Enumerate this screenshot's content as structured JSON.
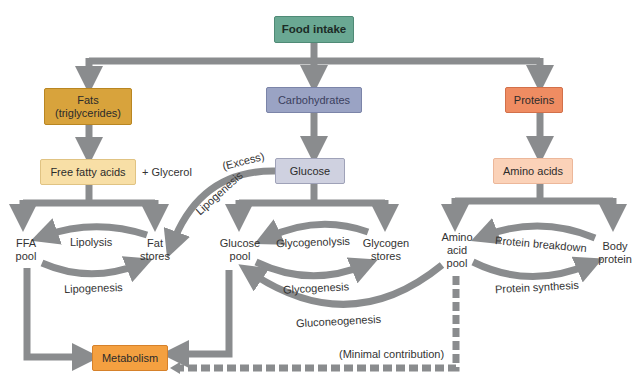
{
  "boxes": {
    "food_intake": "Food intake",
    "fats_line1": "Fats",
    "fats_line2": "(triglycerides)",
    "carbohydrates": "Carbohydrates",
    "proteins": "Proteins",
    "free_fatty_acids": "Free fatty acids",
    "glucose": "Glucose",
    "amino_acids": "Amino acids",
    "metabolism": "Metabolism"
  },
  "labels": {
    "glycerol": "+ Glycerol",
    "ffa_pool_1": "FFA",
    "ffa_pool_2": "pool",
    "fat_stores_1": "Fat",
    "fat_stores_2": "stores",
    "glucose_pool_1": "Glucose",
    "glucose_pool_2": "pool",
    "glycogen_stores_1": "Glycogen",
    "glycogen_stores_2": "stores",
    "amino_pool_1": "Amino",
    "amino_pool_2": "acid",
    "amino_pool_3": "pool",
    "body_protein_1": "Body",
    "body_protein_2": "protein"
  },
  "processes": {
    "lipolysis": "Lipolysis",
    "lipogenesis_fat": "Lipogenesis",
    "excess": "(Excess)",
    "lipogenesis_glucose": "Lipogenesis",
    "glycogenolysis": "Glycogenolysis",
    "glycogenesis": "Glycogenesis",
    "gluconeogenesis": "Gluconeogenesis",
    "protein_breakdown": "Protein breakdown",
    "protein_synthesis": "Protein synthesis",
    "minimal_contribution": "(Minimal contribution)"
  },
  "colors": {
    "arrow": "#8a8c8e",
    "food_intake": "#6aa893",
    "fats": "#d8a33c",
    "carbohydrates": "#9aa3c4",
    "proteins": "#ef8c62",
    "free_fatty_acids": "#f8dfa6",
    "glucose": "#cfd1e0",
    "amino_acids": "#fbd2b8",
    "metabolism": "#f4a040"
  }
}
